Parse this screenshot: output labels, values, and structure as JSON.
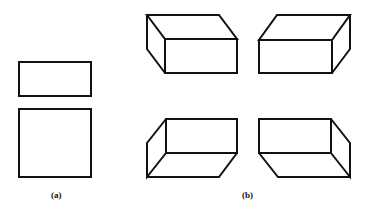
{
  "figure": {
    "panels": [
      {
        "id": "a",
        "label": "(a)",
        "description": "Two orthographic views: top view rectangle and front view square",
        "shapes": [
          {
            "name": "top-view-rectangle",
            "x": 19,
            "y": 62,
            "w": 72,
            "h": 34
          },
          {
            "name": "front-view-square",
            "x": 19,
            "y": 109,
            "w": 72,
            "h": 68
          }
        ]
      },
      {
        "id": "b",
        "label": "(b)",
        "description": "Four isometric boxes seen from different viewing directions",
        "boxes": [
          {
            "name": "box-top-left",
            "view": "from above-left"
          },
          {
            "name": "box-top-right",
            "view": "from above-right"
          },
          {
            "name": "box-bottom-left",
            "view": "from below-left"
          },
          {
            "name": "box-bottom-right",
            "view": "from below-right"
          }
        ]
      }
    ],
    "stroke_color": "#111111",
    "background": "#ffffff"
  }
}
